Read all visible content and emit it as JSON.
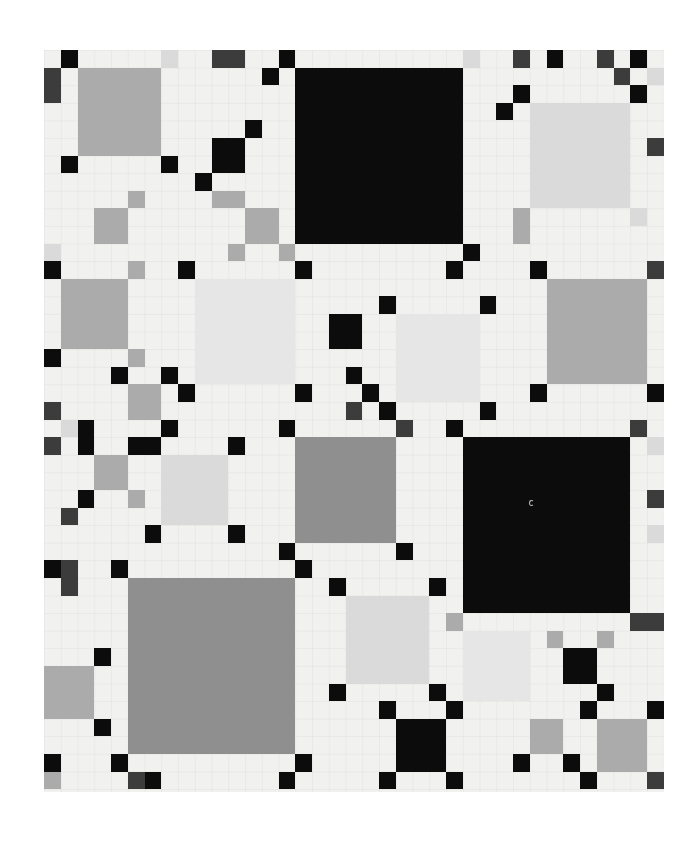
{
  "artwork": {
    "grid": {
      "cols": 37,
      "rows": 42,
      "unit_x": 16.75,
      "unit_y": 17.6,
      "origin_x": 44,
      "origin_y": 50
    },
    "tones": {
      "black": "#0c0c0c",
      "dark": "#3c3c3c",
      "gray": "#ababab",
      "graydark": "#8f8f8f",
      "light": "#dadada",
      "pale": "#e6e6e6",
      "ground": "#f1f1f0"
    },
    "blocks": [
      [
        15,
        1,
        10,
        10,
        "black"
      ],
      [
        25,
        22,
        10,
        10,
        "black"
      ],
      [
        5,
        30,
        10,
        10,
        "graydark"
      ],
      [
        2,
        1,
        5,
        5,
        "gray"
      ],
      [
        29,
        3,
        6,
        6,
        "light"
      ],
      [
        1,
        13,
        4,
        4,
        "gray"
      ],
      [
        9,
        13,
        6,
        6,
        "pale"
      ],
      [
        30,
        13,
        6,
        6,
        "gray"
      ],
      [
        21,
        15,
        5,
        5,
        "pale"
      ],
      [
        15,
        22,
        6,
        6,
        "graydark"
      ],
      [
        7,
        23,
        4,
        4,
        "light"
      ],
      [
        18,
        31,
        5,
        5,
        "light"
      ],
      [
        25,
        33,
        4,
        4,
        "pale"
      ],
      [
        0,
        35,
        3,
        3,
        "gray"
      ],
      [
        33,
        38,
        3,
        3,
        "gray"
      ],
      [
        1,
        0,
        1,
        1,
        "black"
      ],
      [
        0,
        1,
        1,
        2,
        "dark"
      ],
      [
        7,
        0,
        1,
        1,
        "light"
      ],
      [
        10,
        0,
        2,
        1,
        "dark"
      ],
      [
        14,
        0,
        1,
        1,
        "black"
      ],
      [
        13,
        1,
        1,
        1,
        "black"
      ],
      [
        12,
        4,
        1,
        1,
        "black"
      ],
      [
        10,
        5,
        2,
        2,
        "black"
      ],
      [
        1,
        6,
        1,
        1,
        "black"
      ],
      [
        7,
        6,
        1,
        1,
        "black"
      ],
      [
        9,
        7,
        1,
        1,
        "black"
      ],
      [
        5,
        8,
        1,
        1,
        "gray"
      ],
      [
        10,
        8,
        2,
        1,
        "gray"
      ],
      [
        3,
        9,
        2,
        2,
        "gray"
      ],
      [
        12,
        9,
        2,
        2,
        "gray"
      ],
      [
        0,
        11,
        1,
        1,
        "light"
      ],
      [
        0,
        12,
        1,
        1,
        "black"
      ],
      [
        5,
        12,
        1,
        1,
        "gray"
      ],
      [
        8,
        12,
        1,
        1,
        "black"
      ],
      [
        11,
        11,
        1,
        1,
        "gray"
      ],
      [
        14,
        11,
        1,
        1,
        "gray"
      ],
      [
        15,
        12,
        1,
        1,
        "black"
      ],
      [
        25,
        0,
        1,
        1,
        "light"
      ],
      [
        28,
        0,
        1,
        1,
        "dark"
      ],
      [
        30,
        0,
        1,
        1,
        "black"
      ],
      [
        33,
        0,
        1,
        1,
        "dark"
      ],
      [
        35,
        0,
        1,
        1,
        "black"
      ],
      [
        34,
        1,
        1,
        1,
        "dark"
      ],
      [
        36,
        1,
        1,
        1,
        "light"
      ],
      [
        28,
        2,
        1,
        1,
        "black"
      ],
      [
        35,
        2,
        1,
        1,
        "black"
      ],
      [
        27,
        3,
        1,
        1,
        "black"
      ],
      [
        36,
        5,
        1,
        1,
        "dark"
      ],
      [
        28,
        9,
        1,
        2,
        "gray"
      ],
      [
        35,
        9,
        1,
        1,
        "light"
      ],
      [
        25,
        11,
        1,
        1,
        "black"
      ],
      [
        24,
        12,
        1,
        1,
        "black"
      ],
      [
        29,
        12,
        1,
        1,
        "black"
      ],
      [
        36,
        12,
        1,
        1,
        "dark"
      ],
      [
        17,
        15,
        2,
        2,
        "black"
      ],
      [
        20,
        14,
        1,
        1,
        "black"
      ],
      [
        26,
        14,
        1,
        1,
        "black"
      ],
      [
        0,
        17,
        1,
        1,
        "black"
      ],
      [
        5,
        17,
        1,
        1,
        "gray"
      ],
      [
        4,
        18,
        1,
        1,
        "black"
      ],
      [
        7,
        18,
        1,
        1,
        "black"
      ],
      [
        5,
        19,
        2,
        2,
        "gray"
      ],
      [
        8,
        19,
        1,
        1,
        "black"
      ],
      [
        15,
        19,
        1,
        1,
        "black"
      ],
      [
        0,
        20,
        1,
        1,
        "dark"
      ],
      [
        1,
        21,
        1,
        1,
        "light"
      ],
      [
        2,
        21,
        1,
        2,
        "black"
      ],
      [
        7,
        21,
        1,
        1,
        "black"
      ],
      [
        14,
        21,
        1,
        1,
        "black"
      ],
      [
        18,
        18,
        1,
        1,
        "black"
      ],
      [
        19,
        19,
        1,
        1,
        "black"
      ],
      [
        29,
        19,
        1,
        1,
        "black"
      ],
      [
        36,
        19,
        1,
        1,
        "black"
      ],
      [
        18,
        20,
        1,
        1,
        "dark"
      ],
      [
        20,
        20,
        1,
        1,
        "black"
      ],
      [
        26,
        20,
        1,
        1,
        "black"
      ],
      [
        21,
        21,
        1,
        1,
        "dark"
      ],
      [
        24,
        21,
        1,
        1,
        "black"
      ],
      [
        35,
        21,
        1,
        1,
        "dark"
      ],
      [
        0,
        22,
        1,
        1,
        "dark"
      ],
      [
        5,
        22,
        2,
        1,
        "black"
      ],
      [
        11,
        22,
        1,
        1,
        "black"
      ],
      [
        3,
        23,
        2,
        2,
        "gray"
      ],
      [
        2,
        25,
        1,
        1,
        "black"
      ],
      [
        5,
        25,
        1,
        1,
        "gray"
      ],
      [
        1,
        26,
        1,
        1,
        "dark"
      ],
      [
        6,
        27,
        1,
        1,
        "black"
      ],
      [
        11,
        27,
        1,
        1,
        "black"
      ],
      [
        14,
        28,
        1,
        1,
        "black"
      ],
      [
        21,
        28,
        1,
        1,
        "black"
      ],
      [
        0,
        29,
        1,
        1,
        "black"
      ],
      [
        1,
        29,
        1,
        2,
        "dark"
      ],
      [
        4,
        29,
        1,
        1,
        "black"
      ],
      [
        15,
        29,
        1,
        1,
        "black"
      ],
      [
        17,
        30,
        1,
        1,
        "black"
      ],
      [
        23,
        30,
        1,
        1,
        "black"
      ],
      [
        36,
        22,
        1,
        1,
        "light"
      ],
      [
        36,
        25,
        1,
        1,
        "dark"
      ],
      [
        36,
        27,
        1,
        1,
        "light"
      ],
      [
        24,
        32,
        1,
        1,
        "gray"
      ],
      [
        35,
        32,
        2,
        1,
        "dark"
      ],
      [
        30,
        33,
        1,
        1,
        "gray"
      ],
      [
        33,
        33,
        1,
        1,
        "gray"
      ],
      [
        31,
        34,
        2,
        2,
        "black"
      ],
      [
        3,
        34,
        1,
        1,
        "black"
      ],
      [
        17,
        36,
        1,
        1,
        "black"
      ],
      [
        23,
        36,
        1,
        1,
        "black"
      ],
      [
        33,
        36,
        1,
        1,
        "black"
      ],
      [
        20,
        37,
        1,
        1,
        "black"
      ],
      [
        24,
        37,
        1,
        1,
        "black"
      ],
      [
        32,
        37,
        1,
        1,
        "black"
      ],
      [
        36,
        37,
        1,
        1,
        "black"
      ],
      [
        3,
        38,
        1,
        1,
        "black"
      ],
      [
        21,
        38,
        3,
        3,
        "black"
      ],
      [
        29,
        38,
        2,
        2,
        "gray"
      ],
      [
        0,
        40,
        1,
        1,
        "black"
      ],
      [
        4,
        40,
        1,
        1,
        "black"
      ],
      [
        15,
        40,
        1,
        1,
        "black"
      ],
      [
        28,
        40,
        1,
        1,
        "black"
      ],
      [
        31,
        40,
        1,
        1,
        "black"
      ],
      [
        0,
        41,
        1,
        1,
        "gray"
      ],
      [
        5,
        41,
        1,
        1,
        "dark"
      ],
      [
        6,
        41,
        1,
        1,
        "black"
      ],
      [
        14,
        41,
        1,
        1,
        "black"
      ],
      [
        20,
        41,
        1,
        1,
        "black"
      ],
      [
        24,
        41,
        1,
        1,
        "black"
      ],
      [
        32,
        41,
        1,
        1,
        "black"
      ],
      [
        36,
        41,
        1,
        1,
        "dark"
      ]
    ]
  }
}
